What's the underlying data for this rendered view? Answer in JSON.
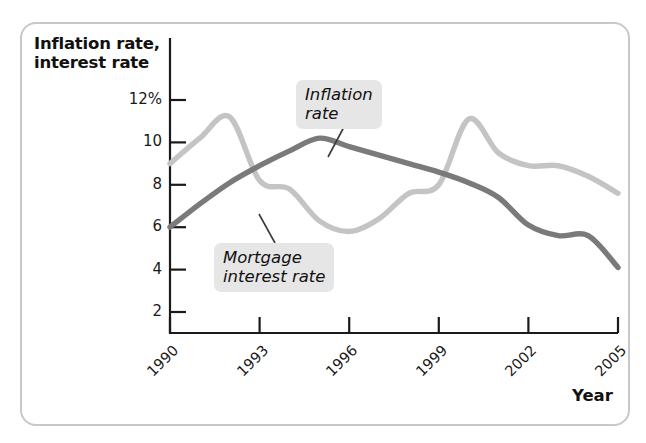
{
  "axes": {
    "y_title": "Inflation rate,\ninterest rate",
    "x_title": "Year",
    "y_ticks": [
      "12%",
      "10",
      "8",
      "6",
      "4",
      "2"
    ],
    "x_ticks": [
      "1990",
      "1993",
      "1996",
      "1999",
      "2002",
      "2005"
    ]
  },
  "callouts": {
    "inflation": "Inflation\nrate",
    "mortgage": "Mortgage\ninterest rate"
  },
  "colors": {
    "inflation_line": "#7a7a7a",
    "mortgage_line": "#c4c4c4",
    "axis": "#1a1a1a",
    "callout_bg": "#e6e6e6",
    "frame": "#c8c8c8"
  },
  "chart_data": {
    "type": "line",
    "title": "",
    "xlabel": "Year",
    "ylabel": "Inflation rate, interest rate",
    "xlim": [
      1990,
      2005
    ],
    "ylim": [
      0,
      13
    ],
    "ytick_values": [
      12,
      10,
      8,
      6,
      4,
      2
    ],
    "xtick_values": [
      1990,
      1993,
      1996,
      1999,
      2002,
      2005
    ],
    "grid": false,
    "legend": "inline-callouts",
    "series": [
      {
        "name": "Inflation rate",
        "color": "#7a7a7a",
        "x": [
          1990,
          1991,
          1992,
          1993,
          1994,
          1995,
          1996,
          1997,
          1998,
          1999,
          2000,
          2001,
          2002,
          2003,
          2004,
          2005
        ],
        "values": [
          6.0,
          7.1,
          8.1,
          8.9,
          9.6,
          10.2,
          9.8,
          9.4,
          9.0,
          8.6,
          8.1,
          7.4,
          6.1,
          5.6,
          5.6,
          4.1
        ]
      },
      {
        "name": "Mortgage interest rate",
        "color": "#c4c4c4",
        "x": [
          1990,
          1991,
          1992,
          1993,
          1994,
          1995,
          1996,
          1997,
          1998,
          1999,
          2000,
          2001,
          2002,
          2003,
          2004,
          2005
        ],
        "values": [
          9.0,
          10.2,
          11.2,
          8.2,
          7.8,
          6.3,
          5.8,
          6.4,
          7.6,
          8.0,
          11.1,
          9.5,
          8.9,
          8.9,
          8.4,
          7.6
        ]
      }
    ],
    "annotations": [
      {
        "label": "Inflation rate",
        "target_x": 1996.4,
        "target_y": 9.6
      },
      {
        "label": "Mortgage interest rate",
        "target_x": 1994.2,
        "target_y": 6.6
      }
    ]
  }
}
